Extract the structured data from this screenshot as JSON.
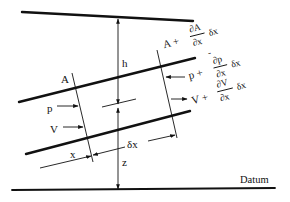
{
  "diagram": {
    "type": "open-channel / pipe flow element",
    "labels": {
      "h": "h",
      "z": "z",
      "x": "x",
      "dx": "δx",
      "datum": "Datum",
      "area_in": "A",
      "pressure_in": "p",
      "velocity_in": "V",
      "area_out_base": "A +",
      "area_out_num": "∂A",
      "area_out_den": "∂x",
      "area_out_tail": "δx",
      "pressure_out_base": "p +",
      "pressure_out_num": "∂p",
      "pressure_out_den": "∂x",
      "pressure_out_tail": "δx",
      "pressure_out_bar": "-",
      "velocity_out_base": "V +",
      "velocity_out_num": "∂V",
      "velocity_out_den": "∂x",
      "velocity_out_tail": "δx"
    }
  }
}
